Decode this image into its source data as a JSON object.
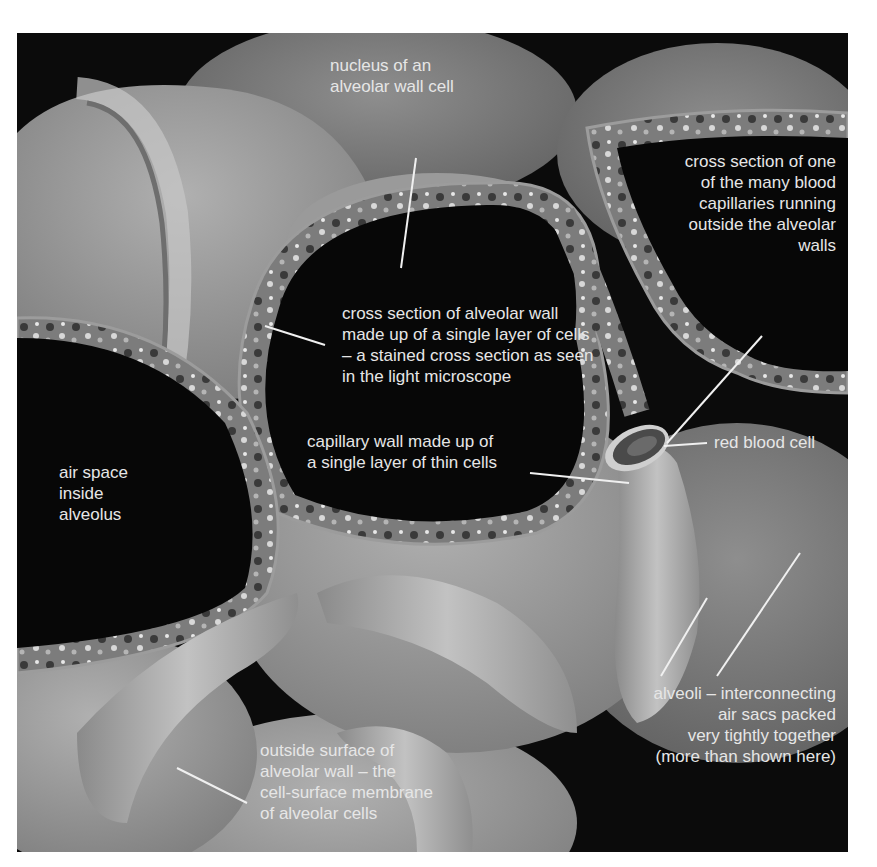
{
  "figure": {
    "colors": {
      "background": "#0b0b0b",
      "alveolus_surface": "#8c8c8c",
      "alveolus_light": "#a8a8a8",
      "wall_section": "#7a7a7a",
      "label_text": "#e6e6e6",
      "leader_line": "#f0f0f0"
    }
  },
  "labels": {
    "nucleus": [
      "nucleus of an",
      "alveolar wall cell"
    ],
    "capillary_section": [
      "cross section of one",
      "of the many blood",
      "capillaries running",
      "outside the alveolar",
      "walls"
    ],
    "alveolar_wall_section": [
      "cross section of alveolar wall",
      "made up of a single layer of cells",
      "– a stained cross section as seen",
      "in the light microscope"
    ],
    "capillary_wall": [
      "capillary wall made up of",
      "a single layer of thin cells"
    ],
    "red_blood_cell": [
      "red blood cell"
    ],
    "air_space": [
      "air space",
      "inside",
      "alveolus"
    ],
    "alveoli": [
      "alveoli – interconnecting",
      "air sacs packed",
      "very tightly together",
      "(more than shown here)"
    ],
    "outside_surface": [
      "outside surface of",
      "alveolar wall – the",
      "cell-surface membrane",
      "of alveolar cells"
    ]
  }
}
